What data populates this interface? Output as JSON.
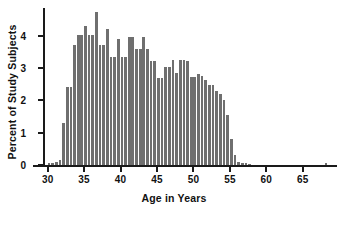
{
  "chart_data": {
    "type": "bar",
    "title": "",
    "subtitle": "",
    "xlabel": "Age in Years",
    "ylabel": "Percent of Study Subjects",
    "xlim": [
      29.5,
      69.0
    ],
    "ylim": [
      0,
      4.85
    ],
    "xticks": [
      30,
      35,
      40,
      45,
      50,
      55,
      60,
      65
    ],
    "yticks": [
      0,
      1,
      2,
      3,
      4
    ],
    "xtick_labels": [
      "30",
      "35",
      "40",
      "45",
      "50",
      "55",
      "60",
      "65"
    ],
    "ytick_labels": [
      "0",
      "1",
      "2",
      "3",
      "4"
    ],
    "bin_width": 0.5,
    "grid": false,
    "legend": null,
    "bar_color": "#6f6f6f",
    "axis_color": "#1a1a1a",
    "background_color": "#ffffff",
    "categories": [
      "30.0",
      "30.5",
      "31.0",
      "31.5",
      "32.0",
      "32.5",
      "33.0",
      "33.5",
      "34.0",
      "34.5",
      "35.0",
      "35.5",
      "36.0",
      "36.5",
      "37.0",
      "37.5",
      "38.0",
      "38.5",
      "39.0",
      "39.5",
      "40.0",
      "40.5",
      "41.0",
      "41.5",
      "42.0",
      "42.5",
      "43.0",
      "43.5",
      "44.0",
      "44.5",
      "45.0",
      "45.5",
      "46.0",
      "46.5",
      "47.0",
      "47.5",
      "48.0",
      "48.5",
      "49.0",
      "49.5",
      "50.0",
      "50.5",
      "51.0",
      "51.5",
      "52.0",
      "52.5",
      "53.0",
      "53.5",
      "54.0",
      "54.5",
      "55.0",
      "55.5",
      "56.0",
      "56.5",
      "57.0",
      "57.5",
      "58.0",
      "58.5",
      "59.0",
      "59.5",
      "60.0",
      "60.5",
      "61.0",
      "61.5",
      "62.0",
      "62.5",
      "63.0",
      "63.5",
      "64.0",
      "64.5",
      "65.0",
      "65.5",
      "66.0",
      "66.5",
      "67.0",
      "67.5",
      "68.0"
    ],
    "values": [
      0.05,
      0.07,
      0.1,
      0.15,
      1.3,
      2.4,
      2.4,
      3.7,
      4.02,
      4.02,
      4.28,
      4.02,
      4.02,
      4.72,
      3.72,
      3.72,
      4.2,
      3.35,
      3.35,
      3.9,
      3.35,
      3.35,
      3.97,
      3.97,
      3.58,
      3.58,
      3.95,
      3.58,
      3.2,
      3.2,
      2.7,
      2.7,
      3.03,
      3.03,
      3.25,
      2.83,
      3.25,
      3.25,
      3.2,
      2.72,
      2.72,
      2.8,
      2.75,
      2.62,
      2.48,
      2.48,
      2.28,
      2.18,
      2.0,
      1.55,
      0.8,
      0.32,
      0.1,
      0.06,
      0.05,
      0.04,
      0.0,
      0.0,
      0.0,
      0.0,
      0.0,
      0.0,
      0.0,
      0.0,
      0.0,
      0.0,
      0.0,
      0.0,
      0.0,
      0.0,
      0.0,
      0.0,
      0.0,
      0.0,
      0.0,
      0.0,
      0.06
    ],
    "bars": [
      {
        "x": 30.0,
        "y": 0.05
      },
      {
        "x": 30.5,
        "y": 0.07
      },
      {
        "x": 31.0,
        "y": 0.1
      },
      {
        "x": 31.5,
        "y": 0.15
      },
      {
        "x": 32.0,
        "y": 1.3
      },
      {
        "x": 32.5,
        "y": 2.4
      },
      {
        "x": 33.0,
        "y": 2.4
      },
      {
        "x": 33.5,
        "y": 3.7
      },
      {
        "x": 34.0,
        "y": 4.02
      },
      {
        "x": 34.5,
        "y": 4.02
      },
      {
        "x": 35.0,
        "y": 4.02
      },
      {
        "x": 35.5,
        "y": 4.28
      },
      {
        "x": 36.0,
        "y": 4.02
      },
      {
        "x": 36.5,
        "y": 4.02
      },
      {
        "x": 37.0,
        "y": 4.02
      },
      {
        "x": 37.5,
        "y": 4.72
      },
      {
        "x": 38.0,
        "y": 4.72
      },
      {
        "x": 38.5,
        "y": 3.72
      },
      {
        "x": 39.0,
        "y": 3.72
      },
      {
        "x": 39.5,
        "y": 4.2
      },
      {
        "x": 40.0,
        "y": 3.35
      },
      {
        "x": 40.5,
        "y": 3.35
      },
      {
        "x": 41.0,
        "y": 3.35
      },
      {
        "x": 41.5,
        "y": 3.9
      },
      {
        "x": 42.0,
        "y": 3.35
      },
      {
        "x": 42.5,
        "y": 3.35
      },
      {
        "x": 43.0,
        "y": 3.97
      },
      {
        "x": 43.5,
        "y": 3.97
      },
      {
        "x": 44.0,
        "y": 3.58
      },
      {
        "x": 44.5,
        "y": 3.58
      },
      {
        "x": 45.0,
        "y": 3.95
      },
      {
        "x": 45.5,
        "y": 3.58
      },
      {
        "x": 46.0,
        "y": 3.2
      },
      {
        "x": 46.5,
        "y": 3.2
      },
      {
        "x": 47.0,
        "y": 2.7
      },
      {
        "x": 47.5,
        "y": 2.7
      },
      {
        "x": 48.0,
        "y": 3.03
      },
      {
        "x": 48.5,
        "y": 3.03
      },
      {
        "x": 49.0,
        "y": 3.25
      },
      {
        "x": 49.5,
        "y": 2.83
      },
      {
        "x": 50.0,
        "y": 3.25
      },
      {
        "x": 50.5,
        "y": 3.25
      },
      {
        "x": 51.0,
        "y": 3.2
      },
      {
        "x": 51.5,
        "y": 2.72
      },
      {
        "x": 52.0,
        "y": 2.72
      },
      {
        "x": 52.5,
        "y": 2.8
      },
      {
        "x": 53.0,
        "y": 2.75
      },
      {
        "x": 53.5,
        "y": 2.62
      },
      {
        "x": 54.0,
        "y": 2.48
      },
      {
        "x": 54.5,
        "y": 2.48
      },
      {
        "x": 55.0,
        "y": 2.28
      },
      {
        "x": 55.5,
        "y": 2.18
      },
      {
        "x": 56.0,
        "y": 2.0
      },
      {
        "x": 56.5,
        "y": 1.55
      },
      {
        "x": 57.0,
        "y": 0.8
      },
      {
        "x": 57.5,
        "y": 0.32
      },
      {
        "x": 58.0,
        "y": 0.1
      },
      {
        "x": 58.5,
        "y": 0.06
      }
    ],
    "annotations": [
      {
        "text": "peak bin near age 38.5 reaching about 4.7 percent"
      },
      {
        "text": "isolated small bar near age 68"
      }
    ]
  }
}
